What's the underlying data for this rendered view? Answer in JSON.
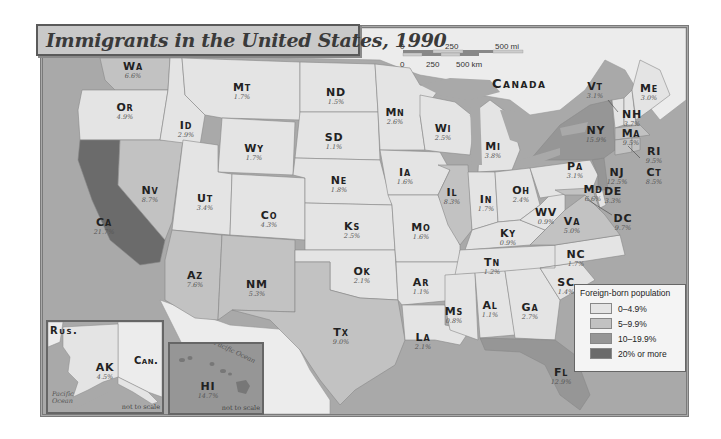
{
  "title": "Immigrants in the United States, 1990",
  "colors": {
    "water": "#a9a9a9",
    "canada": "#ececec",
    "mexico": "#ececec",
    "class_0_4_9": "#e4e4e4",
    "class_5_9_9": "#c2c2c2",
    "class_10_19_9": "#969696",
    "class_20_plus": "#6b6b6b",
    "border": "#7a7a7a"
  },
  "scale_bar": {
    "miles": [
      "0",
      "250",
      "500 mi"
    ],
    "kilometers": [
      "0",
      "250",
      "500 km"
    ]
  },
  "country_labels": {
    "canada": "Canada",
    "rus": "Rus.",
    "can_inset": "Can."
  },
  "legend": {
    "title": "Foreign-born population",
    "items": [
      {
        "label": "0–4.9%",
        "color": "#e4e4e4"
      },
      {
        "label": "5–9.9%",
        "color": "#c2c2c2"
      },
      {
        "label": "10–19.9%",
        "color": "#969696"
      },
      {
        "label": "20% or more",
        "color": "#6b6b6b"
      }
    ]
  },
  "insets": {
    "alaska": {
      "note": "not to scale",
      "ocean": "Pacific Ocean"
    },
    "hawaii": {
      "note": "not to scale",
      "ocean": "Pacific Ocean"
    }
  },
  "states": [
    {
      "abbr": "Wa",
      "pct": "6.6%"
    },
    {
      "abbr": "Or",
      "pct": "4.9%"
    },
    {
      "abbr": "Ca",
      "pct": "21.7%"
    },
    {
      "abbr": "Id",
      "pct": "2.9%"
    },
    {
      "abbr": "Nv",
      "pct": "8.7%"
    },
    {
      "abbr": "Mt",
      "pct": "1.7%"
    },
    {
      "abbr": "Wy",
      "pct": "1.7%"
    },
    {
      "abbr": "Ut",
      "pct": "3.4%"
    },
    {
      "abbr": "Co",
      "pct": "4.3%"
    },
    {
      "abbr": "Az",
      "pct": "7.6%"
    },
    {
      "abbr": "NM",
      "pct": "5.3%"
    },
    {
      "abbr": "ND",
      "pct": "1.5%"
    },
    {
      "abbr": "SD",
      "pct": "1.1%"
    },
    {
      "abbr": "Ne",
      "pct": "1.8%"
    },
    {
      "abbr": "Ks",
      "pct": "2.5%"
    },
    {
      "abbr": "Ok",
      "pct": "2.1%"
    },
    {
      "abbr": "Tx",
      "pct": "9.0%"
    },
    {
      "abbr": "Mn",
      "pct": "2.6%"
    },
    {
      "abbr": "Ia",
      "pct": "1.6%"
    },
    {
      "abbr": "Mo",
      "pct": "1.6%"
    },
    {
      "abbr": "Ar",
      "pct": "1.1%"
    },
    {
      "abbr": "La",
      "pct": "2.1%"
    },
    {
      "abbr": "Wi",
      "pct": "2.5%"
    },
    {
      "abbr": "Il",
      "pct": "8.3%"
    },
    {
      "abbr": "Mi",
      "pct": "3.8%"
    },
    {
      "abbr": "In",
      "pct": "1.7%"
    },
    {
      "abbr": "Oh",
      "pct": "2.4%"
    },
    {
      "abbr": "Ky",
      "pct": "0.9%"
    },
    {
      "abbr": "Tn",
      "pct": "1.2%"
    },
    {
      "abbr": "Ms",
      "pct": "0.8%"
    },
    {
      "abbr": "Al",
      "pct": "1.1%"
    },
    {
      "abbr": "Ga",
      "pct": "2.7%"
    },
    {
      "abbr": "Fl",
      "pct": "12.9%"
    },
    {
      "abbr": "SC",
      "pct": "1.4%"
    },
    {
      "abbr": "NC",
      "pct": "1.7%"
    },
    {
      "abbr": "Va",
      "pct": "5.0%"
    },
    {
      "abbr": "WV",
      "pct": "0.9%"
    },
    {
      "abbr": "Pa",
      "pct": "3.1%"
    },
    {
      "abbr": "NY",
      "pct": "15.9%"
    },
    {
      "abbr": "Vt",
      "pct": "3.1%"
    },
    {
      "abbr": "NH",
      "pct": "3.7%"
    },
    {
      "abbr": "Me",
      "pct": "3.0%"
    },
    {
      "abbr": "Ma",
      "pct": "9.5%"
    },
    {
      "abbr": "RI",
      "pct": "9.5%"
    },
    {
      "abbr": "Ct",
      "pct": "8.5%"
    },
    {
      "abbr": "NJ",
      "pct": "12.5%"
    },
    {
      "abbr": "DE",
      "pct": "3.3%"
    },
    {
      "abbr": "Md",
      "pct": "6.6%"
    },
    {
      "abbr": "DC",
      "pct": "9.7%"
    },
    {
      "abbr": "AK",
      "pct": "4.5%"
    },
    {
      "abbr": "HI",
      "pct": "14.7%"
    }
  ]
}
